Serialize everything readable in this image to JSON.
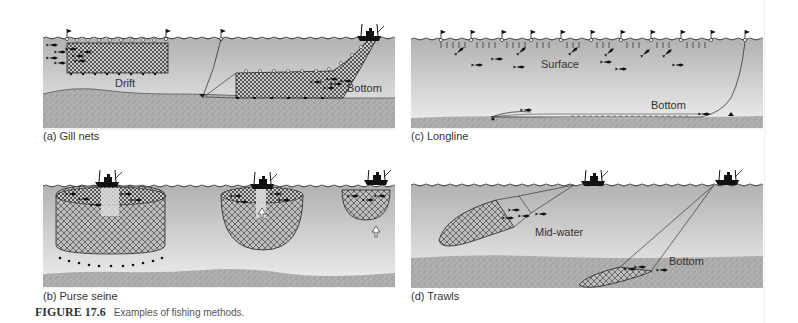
{
  "figure": {
    "number": "FIGURE 17.6",
    "caption": "Examples of fishing methods."
  },
  "panels": [
    {
      "id": "a",
      "caption": "(a) Gill nets",
      "labels": [
        "Drift",
        "Bottom"
      ]
    },
    {
      "id": "b",
      "caption": "(b) Purse seine",
      "labels": []
    },
    {
      "id": "c",
      "caption": "(c) Longline",
      "labels": [
        "Surface",
        "Bottom"
      ]
    },
    {
      "id": "d",
      "caption": "(d) Trawls",
      "labels": [
        "Mid-water",
        "Bottom"
      ]
    }
  ],
  "colors": {
    "water_top": "#b4b4b4",
    "water_bottom": "#efefef",
    "seabed": "#a9a9a9",
    "ink": "#1a1a1a"
  }
}
